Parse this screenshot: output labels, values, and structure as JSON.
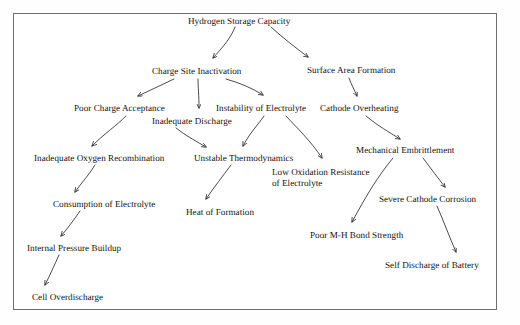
{
  "diagram": {
    "type": "causal-tree",
    "border_color": "#6e6e72",
    "text_color": "#141414",
    "edge_color": "#2a2a2a",
    "background": "#ffffff",
    "nodes": [
      {
        "id": "hydrogen_storage_capacity",
        "label": "Hydrogen Storage Capacity",
        "x": 188,
        "y": 16
      },
      {
        "id": "charge_site_inactivation",
        "label": "Charge Site Inactivation",
        "x": 152,
        "y": 66
      },
      {
        "id": "surface_area_formation",
        "label": "Surface Area Formation",
        "x": 307,
        "y": 65
      },
      {
        "id": "poor_charge_acceptance",
        "label": "Poor Charge Acceptance",
        "x": 74,
        "y": 103
      },
      {
        "id": "instability_of_electrolyte",
        "label": "Instability of Electrolyte",
        "x": 216,
        "y": 103
      },
      {
        "id": "cathode_overheating",
        "label": "Cathode Overheating",
        "x": 320,
        "y": 103
      },
      {
        "id": "inadequate_discharge",
        "label": "Inadequate Discharge",
        "x": 152,
        "y": 116
      },
      {
        "id": "inadequate_oxygen_recombination",
        "label": "Inadequate Oxygen Recombination",
        "x": 34,
        "y": 153
      },
      {
        "id": "unstable_thermodynamics",
        "label": "Unstable Thermodynamics",
        "x": 194,
        "y": 153
      },
      {
        "id": "mechanical_embrittlement",
        "label": "Mechanical Embrittlement",
        "x": 356,
        "y": 145
      },
      {
        "id": "low_oxidation_resistance_of_electrolyte",
        "label": "Low Oxidation Resistance\nof Electrolyte",
        "x": 272,
        "y": 167
      },
      {
        "id": "consumption_of_electrolyte",
        "label": "Consumption of Electrolyte",
        "x": 53,
        "y": 199
      },
      {
        "id": "heat_of_formation",
        "label": "Heat of Formation",
        "x": 186,
        "y": 207
      },
      {
        "id": "severe_cathode_corrosion",
        "label": "Severe Cathode Corrosion",
        "x": 379,
        "y": 194
      },
      {
        "id": "internal_pressure_buildup",
        "label": "Internal Pressure Buildup",
        "x": 27,
        "y": 243
      },
      {
        "id": "poor_mh_bond_strength",
        "label": "Poor M-H Bond Strength",
        "x": 310,
        "y": 230
      },
      {
        "id": "self_discharge_of_battery",
        "label": "Self Discharge of Battery",
        "x": 385,
        "y": 260
      },
      {
        "id": "cell_overdischarge",
        "label": "Cell Overdischarge",
        "x": 32,
        "y": 292
      }
    ],
    "edges": [
      {
        "from": "hydrogen_storage_capacity",
        "to": "charge_site_inactivation"
      },
      {
        "from": "hydrogen_storage_capacity",
        "to": "surface_area_formation"
      },
      {
        "from": "charge_site_inactivation",
        "to": "poor_charge_acceptance"
      },
      {
        "from": "charge_site_inactivation",
        "to": "inadequate_discharge"
      },
      {
        "from": "charge_site_inactivation",
        "to": "instability_of_electrolyte"
      },
      {
        "from": "surface_area_formation",
        "to": "cathode_overheating"
      },
      {
        "from": "poor_charge_acceptance",
        "to": "inadequate_oxygen_recombination"
      },
      {
        "from": "inadequate_discharge",
        "to": "unstable_thermodynamics"
      },
      {
        "from": "instability_of_electrolyte",
        "to": "unstable_thermodynamics"
      },
      {
        "from": "instability_of_electrolyte",
        "to": "low_oxidation_resistance_of_electrolyte"
      },
      {
        "from": "cathode_overheating",
        "to": "mechanical_embrittlement"
      },
      {
        "from": "inadequate_oxygen_recombination",
        "to": "consumption_of_electrolyte"
      },
      {
        "from": "unstable_thermodynamics",
        "to": "heat_of_formation"
      },
      {
        "from": "mechanical_embrittlement",
        "to": "poor_mh_bond_strength"
      },
      {
        "from": "mechanical_embrittlement",
        "to": "severe_cathode_corrosion"
      },
      {
        "from": "consumption_of_electrolyte",
        "to": "internal_pressure_buildup"
      },
      {
        "from": "severe_cathode_corrosion",
        "to": "self_discharge_of_battery"
      },
      {
        "from": "internal_pressure_buildup",
        "to": "cell_overdischarge"
      }
    ]
  }
}
